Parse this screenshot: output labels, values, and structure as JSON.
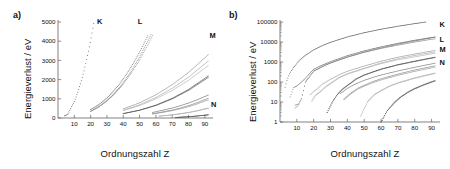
{
  "figure": {
    "panels": [
      {
        "tag": "a)",
        "xlabel": "Ordnungszahl Z",
        "ylabel": "Energieverlust / eV",
        "scale": "linear"
      },
      {
        "tag": "b)",
        "xlabel": "Ordnungszahl Z",
        "ylabel": "Energieverlust / eV",
        "scale": "log"
      }
    ]
  },
  "chart_data": [
    {
      "type": "scatter",
      "title": "a)",
      "xlabel": "Ordnungszahl Z",
      "ylabel": "Energieverlust / eV",
      "xscale": "linear",
      "yscale": "linear",
      "xlim": [
        0,
        95
      ],
      "ylim": [
        0,
        5000
      ],
      "xticks": [
        10,
        20,
        30,
        40,
        50,
        60,
        70,
        80,
        90
      ],
      "yticks": [
        0,
        1000,
        2000,
        3000,
        4000,
        5000
      ],
      "grid": false,
      "legend": "inline-labels",
      "annotations": [
        {
          "text": "K",
          "x": 22,
          "y": 5000
        },
        {
          "text": "L",
          "x": 47,
          "y": 5000
        },
        {
          "text": "M",
          "x": 91,
          "y": 4300
        },
        {
          "text": "N",
          "x": 92,
          "y": 700
        }
      ],
      "series": [
        {
          "name": "K",
          "x": [
            4,
            6,
            8,
            10,
            12,
            14,
            16,
            18,
            20,
            22,
            23
          ],
          "values": [
            111,
            188,
            532,
            867,
            1305,
            1839,
            2472,
            3206,
            4038,
            4966,
            5465
          ]
        },
        {
          "name": "L1",
          "x": [
            20,
            25,
            30,
            35,
            40,
            45,
            50,
            55
          ],
          "values": [
            438,
            695,
            1043,
            1487,
            2033,
            2677,
            3425,
            4280
          ]
        },
        {
          "name": "L2",
          "x": [
            20,
            25,
            30,
            35,
            40,
            45,
            50,
            55,
            57
          ],
          "values": [
            350,
            589,
            907,
            1323,
            1837,
            2451,
            3173,
            4001,
            4350
          ]
        },
        {
          "name": "L3",
          "x": [
            20,
            25,
            30,
            35,
            40,
            45,
            50,
            55,
            58
          ],
          "values": [
            346,
            579,
            888,
            1285,
            1770,
            2348,
            3022,
            3804,
            4300
          ]
        },
        {
          "name": "M1",
          "x": [
            40,
            50,
            60,
            70,
            80,
            90,
            92
          ],
          "values": [
            480,
            790,
            1208,
            1735,
            2373,
            3135,
            3300
          ]
        },
        {
          "name": "M2",
          "x": [
            40,
            50,
            60,
            70,
            80,
            90,
            92
          ],
          "values": [
            410,
            690,
            1068,
            1546,
            2130,
            2820,
            2965
          ]
        },
        {
          "name": "M3",
          "x": [
            40,
            50,
            60,
            70,
            80,
            90,
            92
          ],
          "values": [
            392,
            647,
            995,
            1433,
            1966,
            2597,
            2730
          ]
        },
        {
          "name": "M4",
          "x": [
            40,
            50,
            60,
            70,
            80,
            90,
            92
          ],
          "values": [
            231,
            410,
            670,
            1025,
            1485,
            2065,
            2190
          ]
        },
        {
          "name": "M5",
          "x": [
            40,
            50,
            60,
            70,
            80,
            90,
            92
          ],
          "values": [
            227,
            402,
            652,
            995,
            1438,
            1995,
            2110
          ]
        },
        {
          "name": "N1",
          "x": [
            58,
            65,
            70,
            75,
            80,
            85,
            90,
            92
          ],
          "values": [
            291,
            420,
            520,
            640,
            780,
            940,
            1120,
            1195
          ]
        },
        {
          "name": "N2",
          "x": [
            58,
            65,
            70,
            75,
            80,
            85,
            90,
            92
          ],
          "values": [
            223,
            330,
            415,
            520,
            645,
            790,
            960,
            1030
          ]
        },
        {
          "name": "N3",
          "x": [
            58,
            65,
            70,
            75,
            80,
            85,
            90,
            92
          ],
          "values": [
            206,
            305,
            382,
            478,
            592,
            726,
            882,
            945
          ]
        },
        {
          "name": "N4",
          "x": [
            62,
            70,
            75,
            80,
            85,
            90,
            92
          ],
          "values": [
            100,
            170,
            225,
            295,
            380,
            480,
            522
          ]
        },
        {
          "name": "N5",
          "x": [
            62,
            70,
            75,
            80,
            85,
            90,
            92
          ],
          "values": [
            95,
            162,
            214,
            280,
            360,
            455,
            495
          ]
        },
        {
          "name": "N6",
          "x": [
            72,
            80,
            85,
            90,
            92
          ],
          "values": [
            28,
            70,
            105,
            150,
            170
          ]
        },
        {
          "name": "N7",
          "x": [
            72,
            80,
            85,
            90,
            92
          ],
          "values": [
            26,
            66,
            99,
            142,
            161
          ]
        }
      ]
    },
    {
      "type": "scatter",
      "title": "b)",
      "xlabel": "Ordnungszahl Z",
      "ylabel": "Energieverlust / eV",
      "xscale": "linear",
      "yscale": "log",
      "xlim": [
        0,
        95
      ],
      "ylim": [
        1,
        100000
      ],
      "xticks": [
        10,
        20,
        30,
        40,
        50,
        60,
        70,
        80,
        90
      ],
      "yticks": [
        1,
        10,
        100,
        1000,
        10000,
        100000
      ],
      "grid": false,
      "legend": "inline-labels",
      "annotations": [
        {
          "text": "K",
          "x": 93,
          "y": 72000
        },
        {
          "text": "L",
          "x": 93,
          "y": 14000
        },
        {
          "text": "M",
          "x": 93,
          "y": 4200
        },
        {
          "text": "N",
          "x": 93,
          "y": 900
        }
      ],
      "series": [
        {
          "name": "K",
          "x": [
            3,
            4,
            5,
            6,
            8,
            10,
            12,
            15,
            20,
            25,
            30,
            40,
            50,
            60,
            70,
            80,
            90,
            92
          ],
          "values": [
            55,
            111,
            188,
            284,
            532,
            867,
            1305,
            2146,
            4038,
            6539,
            9659,
            17998,
            29200,
            43569,
            61332,
            83102,
            109651,
            115606
          ]
        },
        {
          "name": "L1",
          "x": [
            6,
            8,
            10,
            12,
            15,
            20,
            25,
            30,
            40,
            50,
            60,
            70,
            80,
            90,
            92
          ],
          "values": [
            18,
            52,
            63,
            89,
            149,
            438,
            695,
            1043,
            2065,
            3604,
            5723,
            8581,
            12284,
            16939,
            17907
          ]
        },
        {
          "name": "L2",
          "x": [
            9,
            11,
            13,
            15,
            20,
            25,
            30,
            40,
            50,
            60,
            70,
            80,
            85,
            90,
            92
          ],
          "values": [
            7,
            8,
            16,
            99,
            350,
            589,
            907,
            1797,
            3173,
            5105,
            7790,
            11304,
            13407,
            16300,
            17166
          ]
        },
        {
          "name": "L3",
          "x": [
            9,
            11,
            13,
            15,
            20,
            25,
            30,
            40,
            50,
            60,
            70,
            80,
            85,
            90,
            92
          ],
          "values": [
            5,
            7,
            15,
            98,
            346,
            579,
            888,
            1729,
            3022,
            4774,
            7011,
            9988,
            11687,
            13733,
            14353
          ]
        },
        {
          "name": "M1",
          "x": [
            18,
            20,
            22,
            25,
            30,
            35,
            40,
            50,
            60,
            70,
            80,
            90,
            92
          ],
          "values": [
            23,
            34,
            44,
            77,
            137,
            228,
            345,
            629,
            1097,
            1735,
            2510,
            3550,
            3730
          ]
        },
        {
          "name": "M2",
          "x": [
            19,
            21,
            24,
            27,
            30,
            35,
            40,
            50,
            60,
            70,
            80,
            90,
            92
          ],
          "values": [
            12,
            22,
            34,
            59,
            87,
            168,
            261,
            490,
            898,
            1444,
            2116,
            3000,
            3150
          ]
        },
        {
          "name": "M3",
          "x": [
            19,
            21,
            24,
            27,
            30,
            35,
            40,
            50,
            60,
            70,
            80,
            90,
            92
          ],
          "values": [
            11,
            20,
            32,
            55,
            81,
            158,
            245,
            461,
            824,
            1297,
            1812,
            2550,
            2695
          ]
        },
        {
          "name": "M4",
          "x": [
            28,
            31,
            34,
            37,
            40,
            45,
            50,
            60,
            70,
            80,
            90,
            92
          ],
          "values": [
            3,
            10,
            24,
            44,
            68,
            140,
            227,
            444,
            740,
            1105,
            1620,
            1730
          ]
        },
        {
          "name": "M5",
          "x": [
            28,
            31,
            34,
            37,
            40,
            45,
            50,
            60,
            70,
            80,
            90,
            92
          ],
          "values": [
            3,
            9,
            23,
            42,
            65,
            135,
            220,
            428,
            710,
            1060,
            1550,
            1655
          ]
        },
        {
          "name": "N1",
          "x": [
            36,
            40,
            45,
            50,
            55,
            60,
            70,
            80,
            90,
            92
          ],
          "values": [
            27,
            48,
            81,
            121,
            168,
            223,
            358,
            545,
            805,
            868
          ]
        },
        {
          "name": "N2",
          "x": [
            38,
            42,
            46,
            50,
            55,
            60,
            70,
            80,
            90,
            92
          ],
          "values": [
            14,
            28,
            48,
            69,
            104,
            145,
            248,
            400,
            595,
            644
          ]
        },
        {
          "name": "N3",
          "x": [
            38,
            42,
            46,
            50,
            55,
            60,
            70,
            80,
            90,
            92
          ],
          "values": [
            13,
            25,
            43,
            62,
            92,
            127,
            215,
            340,
            508,
            548
          ]
        },
        {
          "name": "N4",
          "x": [
            48,
            52,
            56,
            60,
            65,
            70,
            80,
            90,
            92
          ],
          "values": [
            2,
            11,
            24,
            38,
            63,
            92,
            163,
            260,
            282
          ]
        },
        {
          "name": "N5",
          "x": [
            48,
            52,
            56,
            60,
            65,
            70,
            80,
            90,
            92
          ],
          "values": [
            2,
            10,
            22,
            36,
            60,
            87,
            152,
            240,
            260
          ]
        },
        {
          "name": "N6",
          "x": [
            60,
            64,
            68,
            72,
            76,
            80,
            85,
            90,
            92
          ],
          "values": [
            1,
            4,
            10,
            19,
            32,
            48,
            72,
            104,
            118
          ]
        },
        {
          "name": "N7",
          "x": [
            60,
            64,
            68,
            72,
            76,
            80,
            85,
            90,
            92
          ],
          "values": [
            1,
            4,
            9,
            18,
            30,
            45,
            68,
            98,
            111
          ]
        }
      ]
    }
  ]
}
